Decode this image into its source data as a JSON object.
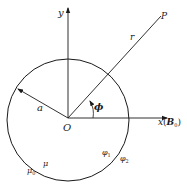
{
  "diagram": {
    "type": "geometry-figure",
    "colors": {
      "stroke": "#1a1a1a",
      "background": "#ffffff"
    },
    "labels": {
      "y_axis": "y",
      "x_axis": "x",
      "x_axis_paren_open": "(",
      "x_axis_field": "B",
      "x_axis_field_sub": "0",
      "x_axis_paren_close": ")",
      "point": "P",
      "radial": "r",
      "radius": "a",
      "origin": "O",
      "angle": "ϕ",
      "inner_permeability": "μ",
      "outer_permeability": "μ",
      "outer_permeability_sub": "0",
      "inner_potential": "φ",
      "inner_potential_sub": "1",
      "outer_potential": "φ",
      "outer_potential_sub": "2"
    },
    "geometry": {
      "origin": [
        68,
        118
      ],
      "circle_radius": 61,
      "point_P": [
        161,
        16
      ],
      "radius_tip": [
        17,
        89
      ]
    }
  }
}
